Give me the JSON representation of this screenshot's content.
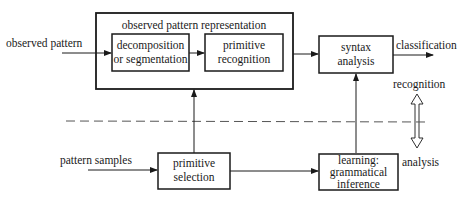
{
  "diagram": {
    "type": "block-diagram",
    "inputs": {
      "observed_pattern": "observed pattern",
      "pattern_samples": "pattern samples"
    },
    "outer_group": {
      "label": "observed pattern representation"
    },
    "blocks": {
      "decomposition": {
        "line1": "decomposition",
        "line2": "or segmentation"
      },
      "primitive_recognition": {
        "line1": "primitive",
        "line2": "recognition"
      },
      "syntax_analysis": {
        "line1": "syntax",
        "line2": "analysis"
      },
      "primitive_selection": {
        "line1": "primitive",
        "line2": "selection"
      },
      "learning": {
        "line1": "learning:",
        "line2": "grammatical",
        "line3": "inference"
      }
    },
    "outputs": {
      "classification": "classification"
    },
    "phases": {
      "recognition": "recognition",
      "analysis": "analysis"
    },
    "edges": [
      {
        "from": "observed pattern",
        "to": "decomposition or segmentation"
      },
      {
        "from": "decomposition or segmentation",
        "to": "primitive recognition"
      },
      {
        "from": "observed pattern representation",
        "to": "syntax analysis"
      },
      {
        "from": "syntax analysis",
        "to": "classification"
      },
      {
        "from": "pattern samples",
        "to": "primitive selection"
      },
      {
        "from": "primitive selection",
        "to": "observed pattern representation"
      },
      {
        "from": "primitive selection",
        "to": "learning: grammatical inference"
      },
      {
        "from": "learning: grammatical inference",
        "to": "syntax analysis"
      }
    ]
  }
}
